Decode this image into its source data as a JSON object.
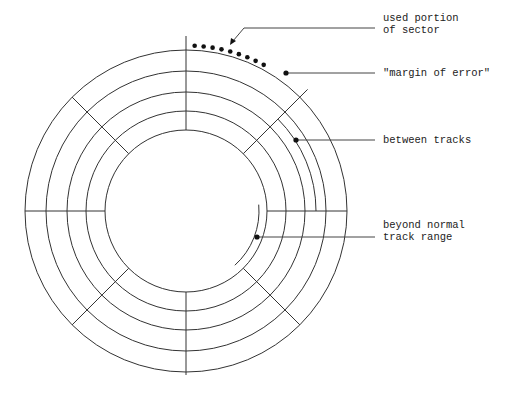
{
  "diagram": {
    "colors": {
      "line": "#333333",
      "dot": "#111111",
      "text": "#222222",
      "background": "#ffffff"
    },
    "center": [
      186,
      211
    ],
    "track_radii": [
      161,
      140,
      119,
      100,
      81
    ],
    "sector_divider_angles_deg": [
      0,
      45,
      90,
      135,
      180,
      225,
      270,
      315
    ],
    "extra_arcs": [
      {
        "name": "between-tracks-arc",
        "radius": 130,
        "from_deg": 45,
        "to_deg": 0
      },
      {
        "name": "beyond-normal-range-arc",
        "radius": 73,
        "from_deg": 5,
        "to_deg": -48
      }
    ],
    "used_portion_dots": 9
  },
  "labels": {
    "used_portion": {
      "line1": "used portion",
      "line2": "of sector"
    },
    "margin_of_error": {
      "text": "\"margin of error\""
    },
    "between_tracks": {
      "text": "between tracks"
    },
    "beyond_normal": {
      "line1": "beyond normal",
      "line2": "track range"
    }
  }
}
